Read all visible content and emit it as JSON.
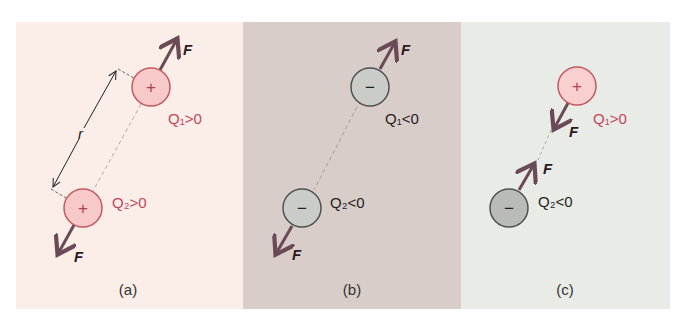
{
  "colors": {
    "panel_a_bg": "#fbeee9",
    "panel_b_bg": "#d9cdca",
    "panel_c_bg": "#e9ebe6",
    "positive_fill": "#f7c9c9",
    "positive_stroke": "#c25a5e",
    "positive_text": "#c0475a",
    "negative_fill": "#c9ccc7",
    "negative_stroke": "#4f5150",
    "negative_text": "#1f1f1f",
    "arrow": "#6b4a57",
    "dashed_line": "#a8a0a0"
  },
  "panels": [
    {
      "id": "a",
      "caption": "(a)",
      "charges": [
        {
          "name": "Q1",
          "sign_symbol": "+",
          "label": "Q₁>0",
          "polarity": "positive"
        },
        {
          "name": "Q2",
          "sign_symbol": "+",
          "label": "Q₂>0",
          "polarity": "positive"
        }
      ],
      "forces": [
        {
          "on": "Q1",
          "label": "F",
          "direction": "away"
        },
        {
          "on": "Q2",
          "label": "F",
          "direction": "away"
        }
      ],
      "distance_label": "r",
      "description": "Like positive charges repel"
    },
    {
      "id": "b",
      "caption": "(b)",
      "charges": [
        {
          "name": "Q1",
          "sign_symbol": "−",
          "label": "Q₁<0",
          "polarity": "negative"
        },
        {
          "name": "Q2",
          "sign_symbol": "−",
          "label": "Q₂<0",
          "polarity": "negative"
        }
      ],
      "forces": [
        {
          "on": "Q1",
          "label": "F",
          "direction": "away"
        },
        {
          "on": "Q2",
          "label": "F",
          "direction": "away"
        }
      ],
      "description": "Like negative charges repel"
    },
    {
      "id": "c",
      "caption": "(c)",
      "charges": [
        {
          "name": "Q1",
          "sign_symbol": "+",
          "label": "Q₁>0",
          "polarity": "positive"
        },
        {
          "name": "Q2",
          "sign_symbol": "−",
          "label": "Q₂<0",
          "polarity": "negative"
        }
      ],
      "forces": [
        {
          "on": "Q1",
          "label": "F",
          "direction": "toward"
        },
        {
          "on": "Q2",
          "label": "F",
          "direction": "toward"
        }
      ],
      "description": "Opposite charges attract"
    }
  ]
}
